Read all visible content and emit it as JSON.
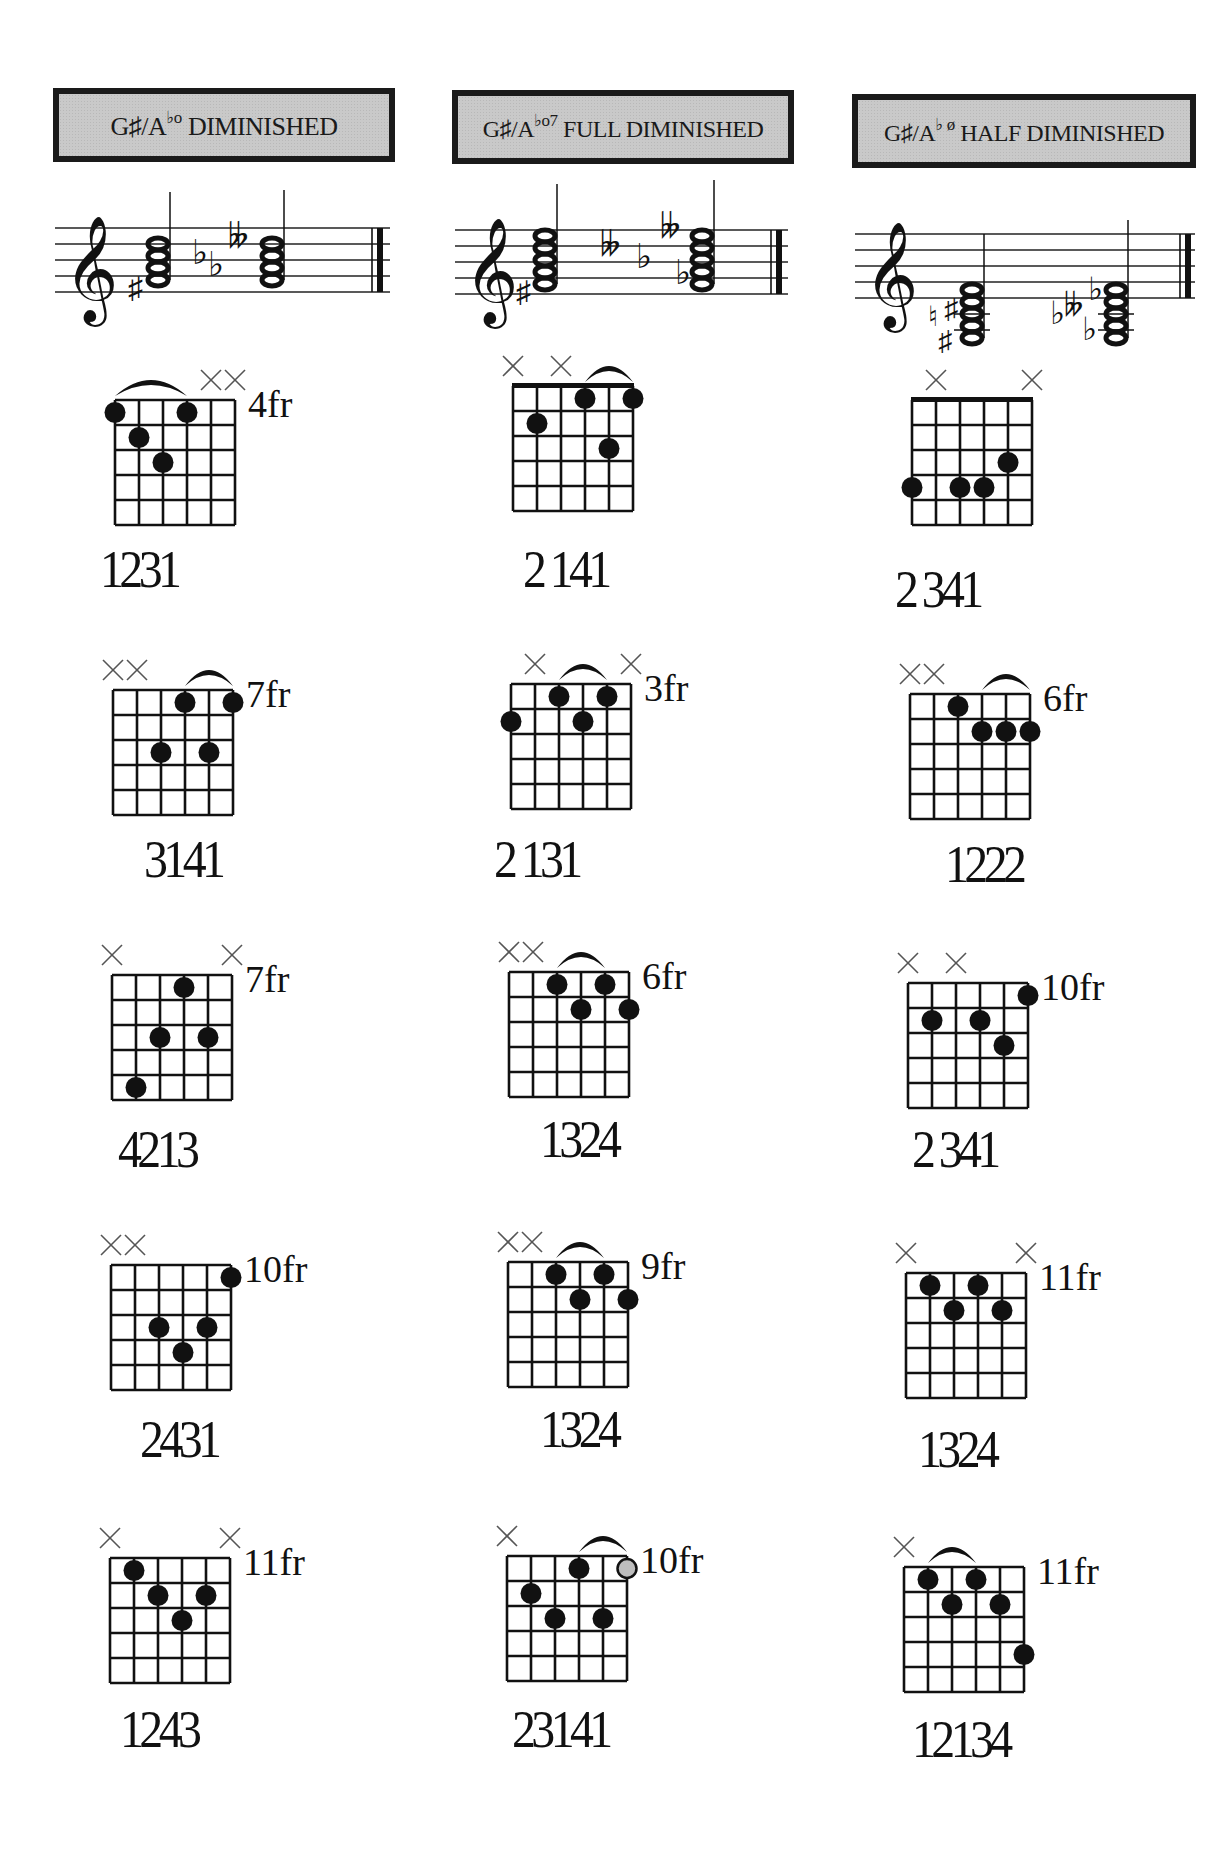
{
  "page": {
    "background": "#ffffff",
    "title_box_fill": "#c9c9c9",
    "ink": "#111111",
    "open_circle_fill": "#bdbdbd"
  },
  "columns": [
    {
      "title": {
        "root": "G♯/A",
        "symbol": "♭o",
        "quality": "DIMINISHED"
      },
      "staff": {
        "clef": "treble",
        "chords": [
          {
            "accidentals": [
              "♯"
            ],
            "notes": "G♯ B D stacked",
            "stem": "up"
          },
          {
            "accidentals": [
              "♭",
              "♭",
              "♭♭"
            ],
            "notes": "A♭ C♭ E♭♭ stacked",
            "stem": "up"
          }
        ]
      },
      "diagrams": [
        {
          "fret_label": "4fr",
          "mutes": [
            5,
            6
          ],
          "barre": [
            1,
            4
          ],
          "dots": [
            [
              1,
              1
            ],
            [
              2,
              2
            ],
            [
              3,
              3
            ],
            [
              4,
              1
            ]
          ],
          "open_dots": [],
          "fingering": "1231"
        },
        {
          "fret_label": "7fr",
          "mutes": [
            1,
            2
          ],
          "barre": [
            4,
            6
          ],
          "dots": [
            [
              4,
              1
            ],
            [
              6,
              1
            ],
            [
              3,
              3
            ],
            [
              5,
              3
            ]
          ],
          "open_dots": [],
          "fingering": "3141"
        },
        {
          "fret_label": "7fr",
          "mutes": [
            1,
            6
          ],
          "barre": null,
          "dots": [
            [
              4,
              1
            ],
            [
              3,
              3
            ],
            [
              5,
              3
            ],
            [
              2,
              5
            ]
          ],
          "open_dots": [],
          "fingering": "4213"
        },
        {
          "fret_label": "10fr",
          "mutes": [
            1,
            2
          ],
          "barre": null,
          "dots": [
            [
              6,
              1
            ],
            [
              3,
              3
            ],
            [
              5,
              3
            ],
            [
              4,
              4
            ]
          ],
          "open_dots": [],
          "fingering": "2431"
        },
        {
          "fret_label": "11fr",
          "mutes": [
            1,
            6
          ],
          "barre": null,
          "dots": [
            [
              2,
              1
            ],
            [
              3,
              2
            ],
            [
              5,
              2
            ],
            [
              4,
              3
            ]
          ],
          "open_dots": [],
          "fingering": "1243"
        }
      ]
    },
    {
      "title": {
        "root": "G♯/A",
        "symbol": "♭o7",
        "quality": "FULL DIMINISHED"
      },
      "staff": {
        "clef": "treble",
        "chords": [
          {
            "accidentals": [
              "♯"
            ],
            "notes": "G♯ B D F stacked",
            "stem": "up"
          },
          {
            "accidentals": [
              "♭♭",
              "♭",
              "♭♭",
              "♭"
            ],
            "notes": "A♭ C♭ E♭♭ G♭♭ stacked",
            "stem": "up"
          }
        ]
      },
      "diagrams": [
        {
          "fret_label": "",
          "nut": true,
          "mutes": [
            1,
            3
          ],
          "barre": [
            4,
            6
          ],
          "dots": [
            [
              4,
              1
            ],
            [
              6,
              1
            ],
            [
              2,
              2
            ],
            [
              5,
              3
            ]
          ],
          "open_dots": [],
          "fingering": "2 141"
        },
        {
          "fret_label": "3fr",
          "mutes": [
            2,
            6
          ],
          "barre": [
            3,
            5
          ],
          "dots": [
            [
              3,
              1
            ],
            [
              5,
              1
            ],
            [
              1,
              2
            ],
            [
              4,
              2
            ]
          ],
          "open_dots": [],
          "fingering": "2 131"
        },
        {
          "fret_label": "6fr",
          "mutes": [
            1,
            2
          ],
          "barre": [
            3,
            5
          ],
          "dots": [
            [
              3,
              1
            ],
            [
              5,
              1
            ],
            [
              4,
              2
            ],
            [
              6,
              2
            ]
          ],
          "open_dots": [],
          "fingering": "1324"
        },
        {
          "fret_label": "9fr",
          "mutes": [
            1,
            2
          ],
          "barre": [
            3,
            5
          ],
          "dots": [
            [
              3,
              1
            ],
            [
              5,
              1
            ],
            [
              4,
              2
            ],
            [
              6,
              2
            ]
          ],
          "open_dots": [],
          "fingering": "1324"
        },
        {
          "fret_label": "10fr",
          "mutes": [
            1
          ],
          "barre": [
            4,
            6
          ],
          "dots": [
            [
              4,
              1
            ],
            [
              2,
              2
            ],
            [
              3,
              3
            ],
            [
              5,
              3
            ]
          ],
          "open_dots": [
            [
              6,
              1
            ]
          ],
          "fingering": "23141"
        }
      ]
    },
    {
      "title": {
        "root": "G♯/A",
        "symbol": "♭ ø",
        "quality": "HALF DIMINISHED"
      },
      "staff": {
        "clef": "treble",
        "chords": [
          {
            "accidentals": [
              "♮",
              "♯",
              "♯"
            ],
            "notes": "G♯ B D F♯ stacked with ledger lines",
            "stem": "up"
          },
          {
            "accidentals": [
              "♭",
              "♭",
              "♭",
              "♭",
              "♭"
            ],
            "notes": "A♭ C♭ E♭♭ G♭ stacked with ledger lines",
            "stem": "up"
          }
        ]
      },
      "diagrams": [
        {
          "fret_label": "",
          "nut": true,
          "mutes": [
            2,
            6
          ],
          "barre": null,
          "dots": [
            [
              5,
              3
            ],
            [
              1,
              4
            ],
            [
              3,
              4
            ],
            [
              4,
              4
            ]
          ],
          "open_dots": [],
          "fingering": "2 341"
        },
        {
          "fret_label": "6fr",
          "mutes": [
            1,
            2
          ],
          "barre": [
            4,
            6
          ],
          "dots": [
            [
              3,
              1
            ],
            [
              4,
              2
            ],
            [
              5,
              2
            ],
            [
              6,
              2
            ]
          ],
          "open_dots": [],
          "fingering": "1222"
        },
        {
          "fret_label": "10fr",
          "mutes": [
            1,
            3
          ],
          "barre": null,
          "dots": [
            [
              6,
              1
            ],
            [
              2,
              2
            ],
            [
              4,
              2
            ],
            [
              5,
              3
            ]
          ],
          "open_dots": [],
          "fingering": "2 341"
        },
        {
          "fret_label": "11fr",
          "mutes": [
            1,
            6
          ],
          "barre": null,
          "dots": [
            [
              2,
              1
            ],
            [
              4,
              1
            ],
            [
              3,
              2
            ],
            [
              5,
              2
            ]
          ],
          "open_dots": [],
          "fingering": "1324"
        },
        {
          "fret_label": "11fr",
          "mutes": [
            1
          ],
          "barre": [
            2,
            4
          ],
          "dots": [
            [
              2,
              1
            ],
            [
              4,
              1
            ],
            [
              3,
              2
            ],
            [
              5,
              2
            ],
            [
              6,
              4
            ]
          ],
          "open_dots": [],
          "fingering": "12134"
        }
      ]
    }
  ]
}
